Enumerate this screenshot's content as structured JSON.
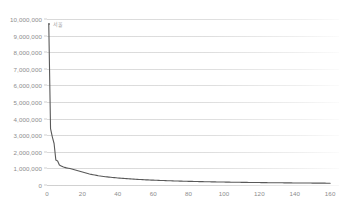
{
  "chart_data": {
    "type": "line",
    "title": "",
    "subtitle": "",
    "xlabel": "",
    "ylabel": "",
    "xlim": [
      0,
      165
    ],
    "ylim": [
      0,
      10000000
    ],
    "grid": true,
    "legend": false,
    "legend_position": "none",
    "line_color": "#595959",
    "y_ticks": [
      {
        "value": 0,
        "label": "0"
      },
      {
        "value": 1000000,
        "label": "1,000,000"
      },
      {
        "value": 2000000,
        "label": "2,000,000"
      },
      {
        "value": 3000000,
        "label": "3,000,000"
      },
      {
        "value": 4000000,
        "label": "4,000,000"
      },
      {
        "value": 5000000,
        "label": "5,000,000"
      },
      {
        "value": 6000000,
        "label": "6,000,000"
      },
      {
        "value": 7000000,
        "label": "7,000,000"
      },
      {
        "value": 8000000,
        "label": "8,000,000"
      },
      {
        "value": 9000000,
        "label": "9,000,000"
      },
      {
        "value": 10000000,
        "label": "10,000,000"
      }
    ],
    "x_ticks": [
      {
        "value": 0,
        "label": "0"
      },
      {
        "value": 20,
        "label": "20"
      },
      {
        "value": 40,
        "label": "40"
      },
      {
        "value": 60,
        "label": "60"
      },
      {
        "value": 80,
        "label": "80"
      },
      {
        "value": 100,
        "label": "100"
      },
      {
        "value": 120,
        "label": "120"
      },
      {
        "value": 140,
        "label": "140"
      },
      {
        "value": 160,
        "label": "160"
      }
    ],
    "annotations": [
      {
        "name": "peak-point-label",
        "text": "서울",
        "x": 1,
        "y": 9700000
      }
    ],
    "series": [
      {
        "name": "population",
        "x": [
          1,
          2,
          3,
          4,
          5,
          6,
          7,
          8,
          9,
          10,
          11,
          12,
          13,
          14,
          15,
          16,
          17,
          18,
          19,
          20,
          21,
          22,
          23,
          24,
          25,
          26,
          27,
          28,
          29,
          30,
          31,
          32,
          33,
          34,
          35,
          36,
          37,
          38,
          39,
          40,
          41,
          42,
          43,
          44,
          45,
          46,
          47,
          48,
          49,
          50,
          51,
          52,
          53,
          54,
          55,
          56,
          57,
          58,
          59,
          60,
          61,
          62,
          63,
          64,
          65,
          66,
          67,
          68,
          69,
          70,
          71,
          72,
          73,
          74,
          75,
          76,
          77,
          78,
          79,
          80,
          81,
          82,
          83,
          84,
          85,
          86,
          87,
          88,
          89,
          90,
          91,
          92,
          93,
          94,
          95,
          96,
          97,
          98,
          99,
          100,
          101,
          102,
          103,
          104,
          105,
          106,
          107,
          108,
          109,
          110,
          111,
          112,
          113,
          114,
          115,
          116,
          117,
          118,
          119,
          120,
          121,
          122,
          123,
          124,
          125,
          126,
          127,
          128,
          129,
          130,
          131,
          132,
          133,
          134,
          135,
          136,
          137,
          138,
          139,
          140,
          141,
          142,
          143,
          144,
          145,
          146,
          147,
          148,
          149,
          150,
          151,
          152,
          153,
          154,
          155,
          156,
          157,
          158,
          159,
          160
        ],
        "values": [
          9700000,
          3400000,
          2900000,
          2500000,
          1500000,
          1450000,
          1200000,
          1150000,
          1100000,
          1060000,
          1030000,
          1010000,
          990000,
          960000,
          930000,
          900000,
          870000,
          840000,
          810000,
          780000,
          750000,
          720000,
          690000,
          660000,
          640000,
          620000,
          600000,
          580000,
          560000,
          545000,
          530000,
          515000,
          500000,
          488000,
          476000,
          465000,
          454000,
          444000,
          434000,
          424000,
          415000,
          406000,
          398000,
          390000,
          382000,
          374000,
          367000,
          360000,
          353000,
          346000,
          340000,
          334000,
          328000,
          322000,
          316000,
          311000,
          306000,
          301000,
          296000,
          291000,
          287000,
          283000,
          279000,
          275000,
          271000,
          267000,
          263000,
          259000,
          255000,
          252000,
          248000,
          245000,
          242000,
          239000,
          236000,
          233000,
          230000,
          227000,
          224000,
          221000,
          219000,
          216000,
          214000,
          211000,
          209000,
          206000,
          204000,
          202000,
          200000,
          197000,
          195000,
          193000,
          191000,
          189000,
          187000,
          185000,
          183000,
          181000,
          179000,
          177000,
          176000,
          174000,
          172000,
          170000,
          169000,
          167000,
          165000,
          164000,
          162000,
          161000,
          159000,
          158000,
          156000,
          155000,
          153000,
          152000,
          151000,
          149000,
          148000,
          147000,
          145000,
          144000,
          143000,
          142000,
          140000,
          139000,
          138000,
          137000,
          136000,
          135000,
          134000,
          133000,
          132000,
          130000,
          129000,
          128000,
          127000,
          126000,
          125000,
          124000,
          123000,
          122000,
          121000,
          121000,
          120000,
          119000,
          118000,
          117000,
          116000,
          115000,
          114000,
          114000,
          113000,
          112000,
          111000,
          110000,
          110000,
          109000,
          108000,
          107000
        ]
      }
    ]
  }
}
